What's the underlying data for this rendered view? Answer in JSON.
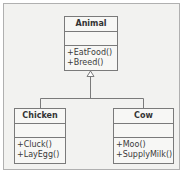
{
  "diagram": {
    "type": "UML class diagram - inheritance",
    "classes": {
      "animal": {
        "name": "Animal",
        "attributes": [],
        "methods": [
          "+EatFood()",
          "+Breed()"
        ]
      },
      "chicken": {
        "name": "Chicken",
        "attributes": [],
        "methods": [
          "+Cluck()",
          "+LayEgg()"
        ]
      },
      "cow": {
        "name": "Cow",
        "attributes": [],
        "methods": [
          "+Moo()",
          "+SupplyMilk()"
        ]
      }
    },
    "relationships": [
      {
        "type": "generalization",
        "from": "Chicken",
        "to": "Animal"
      },
      {
        "type": "generalization",
        "from": "Cow",
        "to": "Animal"
      }
    ],
    "colors": {
      "line": "#7a7a7a",
      "box_fill": "#f7f7f5",
      "frame_fill": "#f2f2f0"
    }
  }
}
